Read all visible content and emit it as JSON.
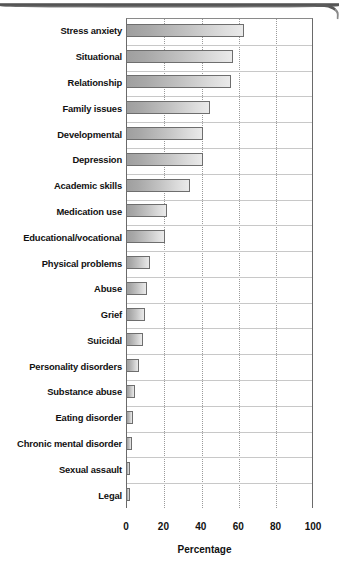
{
  "chart_data": {
    "type": "bar",
    "orientation": "horizontal",
    "title": "",
    "xlabel": "Percentage",
    "ylabel": "",
    "xlim": [
      0,
      100
    ],
    "xticks": [
      0,
      20,
      40,
      60,
      80,
      100
    ],
    "grid": true,
    "legend": false,
    "categories": [
      "Stress anxiety",
      "Situational",
      "Relationship",
      "Family issues",
      "Developmental",
      "Depression",
      "Academic skills",
      "Medication use",
      "Educational/vocational",
      "Physical problems",
      "Abuse",
      "Grief",
      "Suicidal",
      "Personality disorders",
      "Substance abuse",
      "Eating disorder",
      "Chronic mental disorder",
      "Sexual assault",
      "Legal"
    ],
    "values": [
      63,
      57,
      56,
      45,
      41,
      41,
      34,
      22,
      21,
      13,
      11,
      10,
      9,
      7,
      5,
      4,
      3,
      2,
      2
    ],
    "bar_color": "#c2c2c2",
    "bar_edge_color": "#6e6e6e"
  },
  "axis": {
    "x_tick_labels": [
      "0",
      "20",
      "40",
      "60",
      "80",
      "100"
    ],
    "x_title": "Percentage"
  },
  "icons": {
    "page_edge": "page-edge-artifact"
  }
}
